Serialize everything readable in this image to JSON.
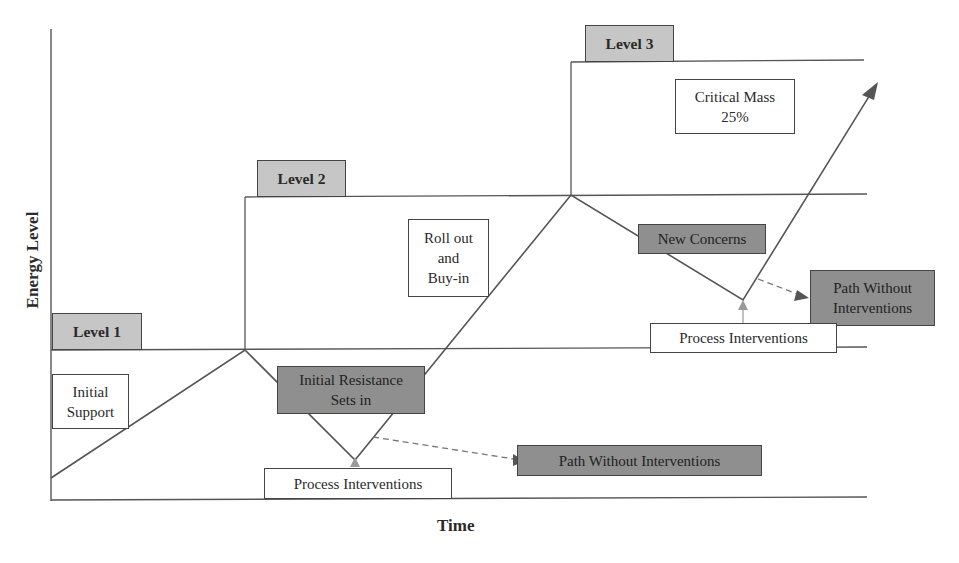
{
  "diagram": {
    "axes": {
      "y_label": "Energy Level",
      "x_label": "Time"
    },
    "levels": [
      {
        "label": "Level 1",
        "y": 350
      },
      {
        "label": "Level 2",
        "y": 195
      },
      {
        "label": "Level 3",
        "y": 61
      }
    ],
    "boxes": {
      "initial_support": [
        "Initial",
        "Support"
      ],
      "initial_resistance": [
        "Initial Resistance",
        "Sets in"
      ],
      "process_interventions_1": [
        "Process Interventions"
      ],
      "path_without_interventions_1": [
        "Path Without Interventions"
      ],
      "roll_out": [
        "Roll out",
        "and",
        "Buy-in"
      ],
      "critical_mass": [
        "Critical Mass",
        "25%"
      ],
      "new_concerns": [
        "New Concerns"
      ],
      "path_without_interventions_2": [
        "Path Without",
        "Interventions"
      ],
      "process_interventions_2": [
        "Process Interventions"
      ]
    },
    "path_points": [
      [
        51,
        478
      ],
      [
        245,
        350
      ],
      [
        355,
        460
      ],
      [
        571,
        195
      ],
      [
        743,
        300
      ],
      [
        878,
        82
      ]
    ],
    "colors": {
      "line": "#555555",
      "level_box": "#c6c6c6",
      "dark_box": "#8f8f8f",
      "arrow_light": "#9a9a9a",
      "dashed": "#777777"
    }
  }
}
